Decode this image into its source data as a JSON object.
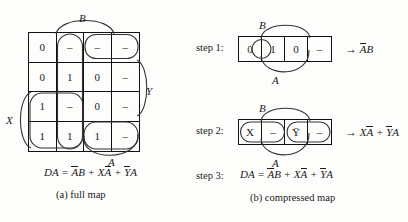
{
  "full_map": {
    "caption": "(a)  full map",
    "top_label": "B",
    "bottom_label": "A",
    "left_label": "X",
    "right_label": "Y",
    "cells": [
      [
        "0",
        "–",
        "–",
        "–"
      ],
      [
        "0",
        "1",
        "0",
        "–"
      ],
      [
        "1",
        "–",
        "0",
        "–"
      ],
      [
        "1",
        "1",
        "1",
        "–"
      ]
    ],
    "formula_lhs": "DA =",
    "formula_terms": [
      {
        "over": "A",
        "plain": "B"
      },
      {
        "plain1": "X",
        "over": "A"
      },
      {
        "over": "Y",
        "plain": "A"
      }
    ],
    "formula_text": "DA = ĀB + XĀ + ȲA"
  },
  "compressed_map": {
    "caption": "(b)  compressed map",
    "steps": [
      {
        "label": "step 1:",
        "top_label": "B",
        "bottom_label": "A",
        "cells": [
          "0",
          "1",
          "0",
          "–"
        ],
        "circled_index": 1,
        "result": "ĀB",
        "result_parts": {
          "over": "A",
          "plain": "B"
        }
      },
      {
        "label": "step 2:",
        "top_label": "B",
        "bottom_label": "A",
        "cells": [
          "X",
          "–",
          "Ȳ",
          "–"
        ],
        "result": "XĀ + ȲA",
        "result_parts": {
          "t1_plain": "X",
          "t1_over": "A",
          "plus": "+",
          "t2_over": "Y",
          "t2_plain": "A"
        }
      },
      {
        "label": "step 3:",
        "formula_lhs": "DA =",
        "formula_text": "DA = ĀB + XĀ + ȲA"
      }
    ],
    "arrow_glyph": "→"
  },
  "colors": {
    "ink": "#1a1a1a",
    "line": "#111111",
    "loop": "#333333",
    "paper": "#fdfdfb"
  }
}
